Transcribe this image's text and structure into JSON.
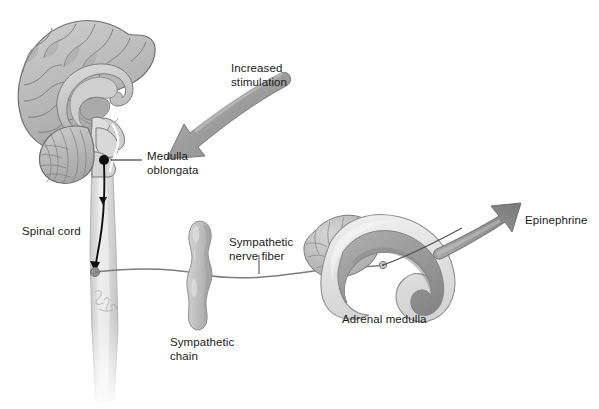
{
  "figure": {
    "type": "anatomical-diagram",
    "background_color": "#ffffff",
    "palette": {
      "brain_fill": "#b9b9b9",
      "brain_outline": "#6e6e6e",
      "brain_light": "#d2d2d2",
      "brain_dark": "#9a9a9a",
      "cord_fill": "#dcdcdc",
      "nerve_line": "#7a7a7a",
      "arrow_gray": "#9c9c9c",
      "arrow_gray_dark": "#6f6f6f",
      "black_arrow": "#111111",
      "adrenal_cortex": "#e2e2e2",
      "adrenal_medulla": "#9e9e9e",
      "text": "#1a1a1a"
    }
  },
  "labels": {
    "increased_stimulation": "Increased\nstimulation",
    "medulla_oblongata": "Medulla\noblongata",
    "spinal_cord": "Spinal cord",
    "sympathetic_nerve_fiber": "Sympathetic\nnerve fiber",
    "sympathetic_chain": "Sympathetic\nchain",
    "adrenal_medulla": "Adrenal medulla",
    "epinephrine": "Epinephrine"
  },
  "label_positions": {
    "increased_stimulation": {
      "x": 231,
      "y": 62
    },
    "medulla_oblongata": {
      "x": 147,
      "y": 150
    },
    "spinal_cord": {
      "x": 22,
      "y": 225
    },
    "sympathetic_nerve_fiber": {
      "x": 229,
      "y": 236
    },
    "sympathetic_chain": {
      "x": 170,
      "y": 336
    },
    "adrenal_medulla": {
      "x": 342,
      "y": 313
    },
    "epinephrine": {
      "x": 525,
      "y": 214
    }
  },
  "structures": [
    {
      "name": "cerebrum",
      "description": "mid-sagittal cerebral hemisphere with gyri and sulci"
    },
    {
      "name": "corpus-callosum",
      "description": "arching pale band above thalamus"
    },
    {
      "name": "thalamus",
      "description": "oval core of diencephalon"
    },
    {
      "name": "cerebellum",
      "description": "foliated structure below occipital lobe"
    },
    {
      "name": "brainstem",
      "description": "midbrain, pons and medulla oblongata"
    },
    {
      "name": "spinal-cord",
      "description": "tapering cord descending from medulla, fading at bottom"
    },
    {
      "name": "sympathetic-chain-ganglion",
      "description": "beaded paravertebral ganglion chain"
    },
    {
      "name": "sympathetic-nerve-fiber",
      "description": "preganglionic fiber from cord through chain to adrenal medulla"
    },
    {
      "name": "adrenal-gland",
      "description": "cut adrenal gland showing pale cortex and darker medulla"
    }
  ],
  "flow": {
    "preganglionic_arrow": "descending black arrow from medulla oblongata down the spinal cord",
    "stimulation_arrow": "large curved gray arrow pointing to the medulla oblongata",
    "secretion_arrow": "large curved gray arrow leaving the adrenal medulla"
  },
  "watermark": "artist signature on spinal cord"
}
